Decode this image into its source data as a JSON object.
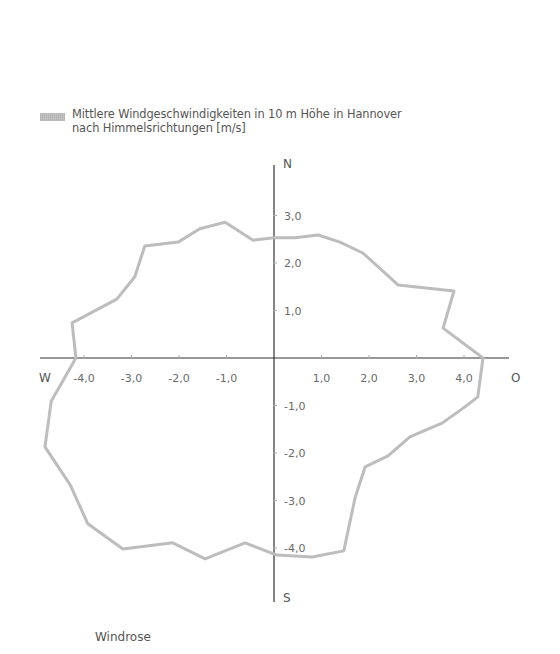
{
  "legend": {
    "line1": "Mittlere Windgeschwindigkeiten in 10 m Höhe in Hannover",
    "line2": "nach Himmelsrichtungen [m/s]",
    "swatch_color": "#b8b8b8"
  },
  "caption": "Windrose",
  "directions": {
    "north": "N",
    "south": "S",
    "west": "W",
    "east": "O"
  },
  "colors": {
    "axis": "#333333",
    "series": "#bdbdbd",
    "text": "#555555"
  },
  "chart_data": {
    "type": "line",
    "subtype": "wind-rose-polygon",
    "title": "Mittlere Windgeschwindigkeiten in 10 m Höhe in Hannover nach Himmelsrichtungen [m/s]",
    "caption": "Windrose",
    "xlabel": "W – O [m/s]",
    "ylabel": "S – N [m/s]",
    "xlim": [
      -5.0,
      5.0
    ],
    "ylim": [
      -5.0,
      4.0
    ],
    "grid": false,
    "legend_position": "top-left",
    "x_ticks": [
      {
        "value": -4,
        "label": "-4,0"
      },
      {
        "value": -3,
        "label": "-3,0"
      },
      {
        "value": -2,
        "label": "-2,0"
      },
      {
        "value": -1,
        "label": "-1,0"
      },
      {
        "value": 1,
        "label": "1,0"
      },
      {
        "value": 2,
        "label": "2,0"
      },
      {
        "value": 3,
        "label": "3,0"
      },
      {
        "value": 4,
        "label": "4,0"
      }
    ],
    "y_ticks": [
      {
        "value": 3,
        "label": "3,0"
      },
      {
        "value": 2,
        "label": "2,0"
      },
      {
        "value": 1,
        "label": "1,0"
      },
      {
        "value": -1,
        "label": "-1,0"
      },
      {
        "value": -2,
        "label": "-2,0"
      },
      {
        "value": -3,
        "label": "-3,0"
      },
      {
        "value": -4,
        "label": "-4,0"
      }
    ],
    "series": [
      {
        "name": "Mittlere Windgeschwindigkeiten in 10 m Höhe in Hannover nach Himmelsrichtungen [m/s]",
        "closed": true,
        "points": [
          [
            -4.17,
            0.0
          ],
          [
            -4.25,
            0.74
          ],
          [
            -3.31,
            1.24
          ],
          [
            -2.93,
            1.71
          ],
          [
            -2.72,
            2.36
          ],
          [
            -2.02,
            2.44
          ],
          [
            -1.56,
            2.72
          ],
          [
            -1.03,
            2.86
          ],
          [
            -0.44,
            2.48
          ],
          [
            0.0,
            2.53
          ],
          [
            0.44,
            2.53
          ],
          [
            0.93,
            2.59
          ],
          [
            1.39,
            2.44
          ],
          [
            1.87,
            2.21
          ],
          [
            2.61,
            1.54
          ],
          [
            3.79,
            1.41
          ],
          [
            3.56,
            0.63
          ],
          [
            4.4,
            0.0
          ],
          [
            4.29,
            -0.82
          ],
          [
            4.02,
            -1.03
          ],
          [
            3.54,
            -1.37
          ],
          [
            2.86,
            -1.66
          ],
          [
            2.4,
            -2.06
          ],
          [
            1.92,
            -2.29
          ],
          [
            1.71,
            -2.93
          ],
          [
            1.47,
            -4.06
          ],
          [
            0.8,
            -4.19
          ],
          [
            0.06,
            -4.15
          ],
          [
            -0.61,
            -3.89
          ],
          [
            -1.45,
            -4.23
          ],
          [
            -2.13,
            -3.89
          ],
          [
            -3.18,
            -4.02
          ],
          [
            -3.92,
            -3.49
          ],
          [
            -4.29,
            -2.67
          ],
          [
            -4.82,
            -1.87
          ],
          [
            -4.69,
            -0.91
          ]
        ]
      }
    ]
  }
}
